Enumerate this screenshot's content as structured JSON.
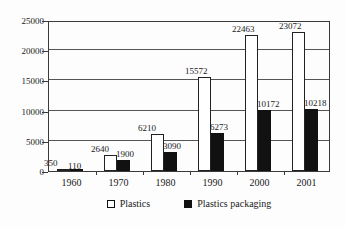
{
  "chart_data": {
    "type": "bar",
    "title": "",
    "xlabel": "",
    "ylabel": "",
    "categories": [
      "1960",
      "1970",
      "1980",
      "1990",
      "2000",
      "2001"
    ],
    "series": [
      {
        "name": "Plastics",
        "color": "#ffffff",
        "marker": "hollow-square",
        "values": [
          350,
          2640,
          6210,
          15572,
          22463,
          23072
        ]
      },
      {
        "name": "Plastics packaging",
        "color": "#111111",
        "marker": "filled-square",
        "values": [
          110,
          1900,
          3090,
          6273,
          10172,
          10218
        ]
      }
    ],
    "ylim": [
      0,
      25000
    ],
    "yticks": [
      0,
      5000,
      10000,
      15000,
      20000,
      25000
    ],
    "ytick_labels": [
      "0",
      "5000",
      "10000",
      "15000",
      "20000",
      "25000"
    ],
    "grid": true,
    "legend_position": "bottom"
  },
  "legend": {
    "items": [
      {
        "label": "Plastics",
        "swatch": "hollow"
      },
      {
        "label": "Plastics packaging",
        "swatch": "filled"
      }
    ]
  }
}
